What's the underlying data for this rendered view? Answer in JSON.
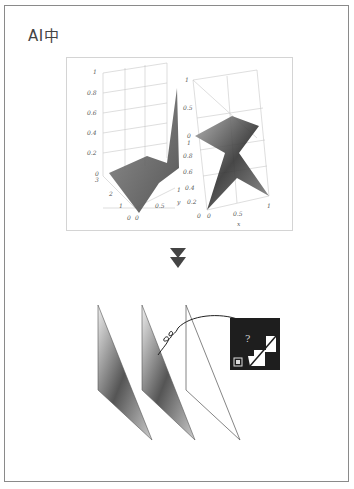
{
  "header": {
    "title": "AI中"
  },
  "plots": {
    "left": {
      "z_ticks": [
        "1",
        "0.8",
        "0.6",
        "0.4",
        "0.2",
        "0"
      ],
      "y_ticks": [
        "3",
        "2",
        "1",
        "0"
      ],
      "x_ticks": [
        "0",
        "0.5",
        "1"
      ]
    },
    "right": {
      "z_ticks": [
        "1",
        "0.5",
        "0"
      ],
      "y_ticks": [
        "1",
        "0.8",
        "0.6",
        "0.4",
        "0.2",
        "0"
      ],
      "y_label": "y",
      "x_ticks": [
        "0",
        "0.5",
        "1"
      ],
      "x_label": "x"
    }
  },
  "transition": {
    "icon": "double-down-arrow-icon"
  },
  "pipeline": {
    "panels": [
      "textured-triangle-1",
      "textured-triangle-2",
      "wireframe-triangle"
    ],
    "inset": {
      "glyph": "?",
      "icon": "texture-map-icon"
    }
  },
  "colors": {
    "frame": "#8a8a8a",
    "ink": "#333333",
    "inset_bg": "#1e1e1e"
  }
}
